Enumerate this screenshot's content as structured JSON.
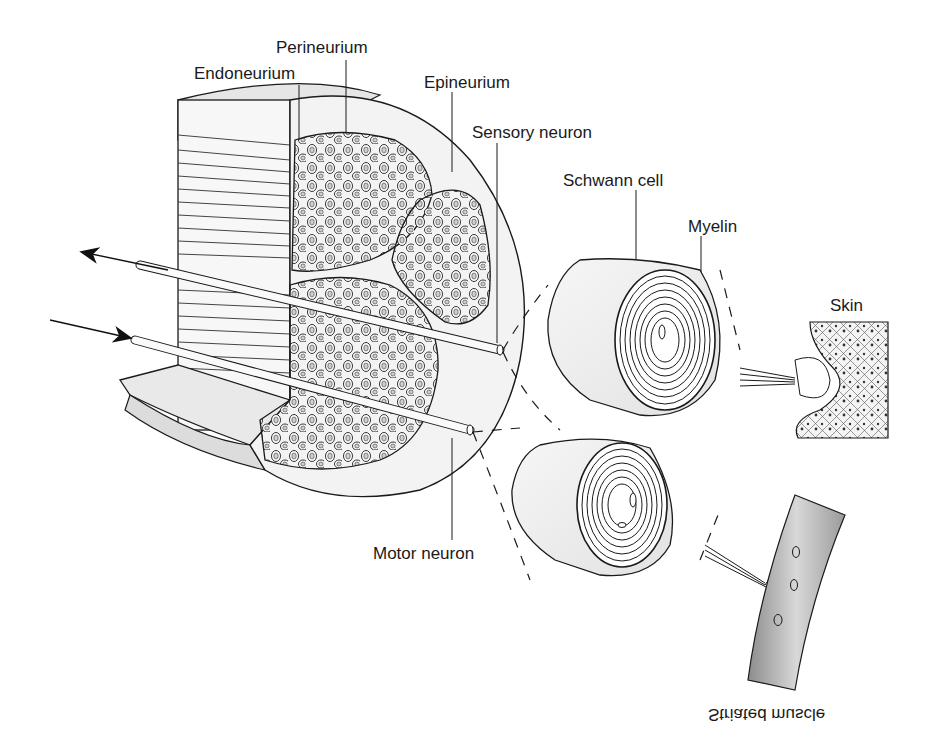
{
  "diagram": {
    "type": "anatomical-illustration",
    "labels": {
      "perineurium": "Perineurium",
      "endoneurium": "Endoneurium",
      "epineurium": "Epineurium",
      "sensory_neuron": "Sensory neuron",
      "schwann_cell": "Schwann cell",
      "myelin": "Myelin",
      "skin": "Skin",
      "motor_neuron": "Motor neuron",
      "striated_muscle": "Striated muscle"
    },
    "arrows": [
      {
        "name": "efferent-arrow",
        "direction": "outward-left"
      },
      {
        "name": "afferent-arrow",
        "direction": "inward-right"
      }
    ],
    "colors": {
      "line": "#1a1a1a",
      "fascicle_fill": "#d8d8d8",
      "sheath_fill": "#efefef",
      "muscle_fill": "#b8b8b8",
      "background": "#ffffff"
    }
  }
}
